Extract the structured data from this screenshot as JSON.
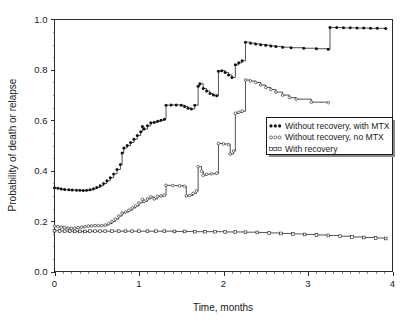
{
  "chart_data": {
    "type": "line",
    "title": "",
    "xlabel": "Time, months",
    "ylabel": "Probability of death or relapse",
    "xlim": [
      0,
      4
    ],
    "ylim": [
      0.0,
      1.0
    ],
    "xticks": [
      "0",
      "1",
      "2",
      "3",
      "4"
    ],
    "xtick_values": [
      0,
      1,
      2,
      3,
      4
    ],
    "yticks": [
      "0.0",
      "0.2",
      "0.4",
      "0.6",
      "0.8",
      "1.0"
    ],
    "ytick_values": [
      0.0,
      0.2,
      0.4,
      0.6,
      0.8,
      1.0
    ],
    "x_minor_interval": 0.1,
    "y_minor_interval": 0.05,
    "grid": false,
    "legend_position": "center-right",
    "step_style": "step-post",
    "series": [
      {
        "name": "Without recovery, with MTX",
        "marker": "filled-circle",
        "legend_key": "●●●",
        "points": [
          [
            0.0,
            0.332
          ],
          [
            0.04,
            0.33
          ],
          [
            0.08,
            0.327
          ],
          [
            0.12,
            0.325
          ],
          [
            0.17,
            0.324
          ],
          [
            0.21,
            0.323
          ],
          [
            0.26,
            0.322
          ],
          [
            0.3,
            0.322
          ],
          [
            0.34,
            0.321
          ],
          [
            0.38,
            0.322
          ],
          [
            0.42,
            0.324
          ],
          [
            0.46,
            0.328
          ],
          [
            0.5,
            0.333
          ],
          [
            0.54,
            0.34
          ],
          [
            0.58,
            0.349
          ],
          [
            0.62,
            0.36
          ],
          [
            0.66,
            0.372
          ],
          [
            0.7,
            0.387
          ],
          [
            0.74,
            0.405
          ],
          [
            0.78,
            0.425
          ],
          [
            0.8,
            0.47
          ],
          [
            0.82,
            0.49
          ],
          [
            0.86,
            0.5
          ],
          [
            0.9,
            0.512
          ],
          [
            0.94,
            0.525
          ],
          [
            0.98,
            0.54
          ],
          [
            1.02,
            0.555
          ],
          [
            1.04,
            0.575
          ],
          [
            1.06,
            0.565
          ],
          [
            1.1,
            0.578
          ],
          [
            1.14,
            0.59
          ],
          [
            1.18,
            0.592
          ],
          [
            1.22,
            0.596
          ],
          [
            1.26,
            0.6
          ],
          [
            1.3,
            0.604
          ],
          [
            1.32,
            0.66
          ],
          [
            1.38,
            0.661
          ],
          [
            1.44,
            0.661
          ],
          [
            1.5,
            0.66
          ],
          [
            1.54,
            0.655
          ],
          [
            1.58,
            0.648
          ],
          [
            1.62,
            0.645
          ],
          [
            1.66,
            0.66
          ],
          [
            1.7,
            0.735
          ],
          [
            1.72,
            0.745
          ],
          [
            1.76,
            0.726
          ],
          [
            1.8,
            0.716
          ],
          [
            1.84,
            0.706
          ],
          [
            1.88,
            0.7
          ],
          [
            1.92,
            0.697
          ],
          [
            1.94,
            0.795
          ],
          [
            1.98,
            0.797
          ],
          [
            2.02,
            0.79
          ],
          [
            2.06,
            0.78
          ],
          [
            2.1,
            0.77
          ],
          [
            2.14,
            0.82
          ],
          [
            2.18,
            0.828
          ],
          [
            2.22,
            0.836
          ],
          [
            2.26,
            0.91
          ],
          [
            2.32,
            0.906
          ],
          [
            2.38,
            0.903
          ],
          [
            2.44,
            0.9
          ],
          [
            2.5,
            0.898
          ],
          [
            2.56,
            0.895
          ],
          [
            2.62,
            0.893
          ],
          [
            2.7,
            0.89
          ],
          [
            2.8,
            0.888
          ],
          [
            2.95,
            0.886
          ],
          [
            3.1,
            0.884
          ],
          [
            3.24,
            0.882
          ],
          [
            3.26,
            0.968
          ],
          [
            3.34,
            0.968
          ],
          [
            3.42,
            0.967
          ],
          [
            3.5,
            0.967
          ],
          [
            3.58,
            0.966
          ],
          [
            3.66,
            0.966
          ],
          [
            3.74,
            0.965
          ],
          [
            3.82,
            0.965
          ],
          [
            3.92,
            0.964
          ]
        ]
      },
      {
        "name": "Without recovery, no MTX",
        "marker": "open-circle",
        "legend_key": "○○○",
        "points": [
          [
            0.0,
            0.18
          ],
          [
            0.04,
            0.178
          ],
          [
            0.08,
            0.176
          ],
          [
            0.12,
            0.174
          ],
          [
            0.16,
            0.172
          ],
          [
            0.2,
            0.171
          ],
          [
            0.24,
            0.172
          ],
          [
            0.28,
            0.174
          ],
          [
            0.32,
            0.176
          ],
          [
            0.36,
            0.178
          ],
          [
            0.4,
            0.18
          ],
          [
            0.44,
            0.181
          ],
          [
            0.48,
            0.182
          ],
          [
            0.52,
            0.182
          ],
          [
            0.56,
            0.182
          ],
          [
            0.6,
            0.184
          ],
          [
            0.64,
            0.19
          ],
          [
            0.68,
            0.198
          ],
          [
            0.72,
            0.208
          ],
          [
            0.76,
            0.22
          ],
          [
            0.8,
            0.232
          ],
          [
            0.84,
            0.236
          ],
          [
            0.88,
            0.243
          ],
          [
            0.92,
            0.252
          ],
          [
            0.96,
            0.26
          ],
          [
            1.0,
            0.272
          ],
          [
            1.04,
            0.286
          ],
          [
            1.06,
            0.278
          ],
          [
            1.1,
            0.288
          ],
          [
            1.14,
            0.296
          ],
          [
            1.18,
            0.288
          ],
          [
            1.22,
            0.298
          ],
          [
            1.26,
            0.3
          ],
          [
            1.3,
            0.302
          ],
          [
            1.32,
            0.342
          ],
          [
            1.4,
            0.341
          ],
          [
            1.48,
            0.34
          ],
          [
            1.54,
            0.338
          ],
          [
            1.56,
            0.3
          ],
          [
            1.6,
            0.302
          ],
          [
            1.64,
            0.31
          ],
          [
            1.68,
            0.32
          ],
          [
            1.7,
            0.416
          ],
          [
            1.74,
            0.398
          ],
          [
            1.76,
            0.382
          ],
          [
            1.8,
            0.386
          ],
          [
            1.86,
            0.388
          ],
          [
            1.92,
            0.39
          ],
          [
            1.94,
            0.508
          ],
          [
            2.0,
            0.506
          ],
          [
            2.06,
            0.504
          ],
          [
            2.08,
            0.466
          ],
          [
            2.12,
            0.478
          ],
          [
            2.14,
            0.628
          ],
          [
            2.18,
            0.632
          ],
          [
            2.22,
            0.636
          ],
          [
            2.26,
            0.76
          ],
          [
            2.32,
            0.756
          ],
          [
            2.38,
            0.75
          ],
          [
            2.44,
            0.74
          ],
          [
            2.5,
            0.73
          ],
          [
            2.56,
            0.722
          ],
          [
            2.62,
            0.712
          ],
          [
            2.7,
            0.7
          ],
          [
            2.78,
            0.69
          ],
          [
            2.86,
            0.684
          ],
          [
            3.04,
            0.672
          ],
          [
            3.24,
            0.67
          ]
        ]
      },
      {
        "name": "With recovery",
        "marker": "open-square",
        "legend_key": "□□□",
        "points": [
          [
            0.0,
            0.162
          ],
          [
            0.06,
            0.161
          ],
          [
            0.12,
            0.16
          ],
          [
            0.18,
            0.16
          ],
          [
            0.24,
            0.159
          ],
          [
            0.3,
            0.159
          ],
          [
            0.36,
            0.159
          ],
          [
            0.42,
            0.16
          ],
          [
            0.48,
            0.16
          ],
          [
            0.54,
            0.16
          ],
          [
            0.6,
            0.16
          ],
          [
            0.68,
            0.16
          ],
          [
            0.76,
            0.16
          ],
          [
            0.84,
            0.16
          ],
          [
            0.92,
            0.16
          ],
          [
            1.0,
            0.16
          ],
          [
            1.1,
            0.16
          ],
          [
            1.2,
            0.16
          ],
          [
            1.3,
            0.16
          ],
          [
            1.42,
            0.159
          ],
          [
            1.54,
            0.159
          ],
          [
            1.66,
            0.158
          ],
          [
            1.78,
            0.158
          ],
          [
            1.9,
            0.158
          ],
          [
            2.02,
            0.157
          ],
          [
            2.14,
            0.157
          ],
          [
            2.26,
            0.156
          ],
          [
            2.4,
            0.155
          ],
          [
            2.54,
            0.153
          ],
          [
            2.68,
            0.151
          ],
          [
            2.82,
            0.149
          ],
          [
            2.96,
            0.147
          ],
          [
            3.1,
            0.145
          ],
          [
            3.24,
            0.143
          ],
          [
            3.38,
            0.14
          ],
          [
            3.52,
            0.137
          ],
          [
            3.66,
            0.135
          ],
          [
            3.8,
            0.133
          ],
          [
            3.92,
            0.131
          ]
        ]
      }
    ]
  },
  "legend": {
    "items": [
      {
        "label": "Without recovery, with MTX",
        "marker": "filled-circle"
      },
      {
        "label": "Without recovery, no MTX",
        "marker": "open-circle"
      },
      {
        "label": "With recovery",
        "marker": "open-square"
      }
    ]
  },
  "colors": {
    "line": "#1a1a1a",
    "marker_fill": "#111111",
    "marker_open_fill": "#ffffff",
    "axis": "#2b2b2b",
    "background": "#ffffff",
    "legend_shadow": "#8a8a8a"
  }
}
